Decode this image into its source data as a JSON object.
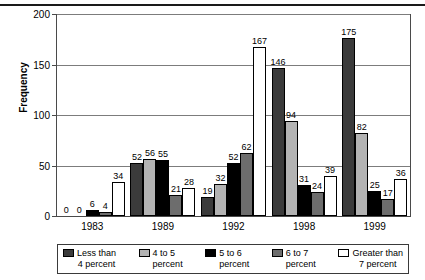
{
  "chart_data": {
    "type": "bar",
    "title": "",
    "xlabel": "",
    "ylabel": "Frequency",
    "ylim": [
      0,
      200
    ],
    "yticks": [
      0,
      50,
      100,
      150,
      200
    ],
    "grid": true,
    "legend_position": "bottom",
    "categories": [
      "1983",
      "1989",
      "1992",
      "1998",
      "1999"
    ],
    "series": [
      {
        "name": "Less than 4 percent",
        "color": "#3b3b3b",
        "values": [
          0,
          52,
          19,
          146,
          175
        ]
      },
      {
        "name": "4 to 5 percent",
        "color": "#b3b3b3",
        "values": [
          0,
          56,
          32,
          94,
          82
        ]
      },
      {
        "name": "5 to 6 percent",
        "color": "#000000",
        "values": [
          6,
          55,
          52,
          31,
          25
        ]
      },
      {
        "name": "6 to 7 percent",
        "color": "#6d6d6d",
        "values": [
          4,
          21,
          62,
          24,
          17
        ]
      },
      {
        "name": "Greater than 7 percent",
        "color": "#ffffff",
        "values": [
          34,
          28,
          167,
          39,
          36
        ]
      }
    ],
    "data_labels": [
      [
        "0",
        "0",
        "6",
        "4",
        "34"
      ],
      [
        "52",
        "56",
        "55",
        "21",
        "28"
      ],
      [
        "19",
        "32",
        "52",
        "62",
        "167"
      ],
      [
        "146",
        "94",
        "31",
        "24",
        "39"
      ],
      [
        "175",
        "82",
        "25",
        "17",
        "36"
      ]
    ]
  },
  "legend": {
    "items": [
      {
        "line1": "Less than",
        "line2": "4 percent"
      },
      {
        "line1": "4 to 5",
        "line2": "percent"
      },
      {
        "line1": "5 to 6",
        "line2": "percent"
      },
      {
        "line1": "6 to 7",
        "line2": "percent"
      },
      {
        "line1": "Greater than",
        "line2": "7 percent"
      }
    ]
  }
}
